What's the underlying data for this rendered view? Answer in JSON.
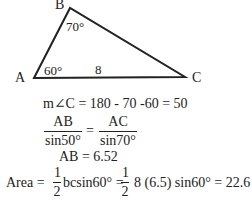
{
  "diagram": {
    "vertices": [
      {
        "name": "A",
        "label": "A"
      },
      {
        "name": "B",
        "label": "B"
      },
      {
        "name": "C",
        "label": "C"
      }
    ],
    "angle_A": "60°",
    "angle_B": "70°",
    "side_AC": "8"
  },
  "solution": {
    "line1": "m∠C = 180 - 70 -60 = 50",
    "law_of_sines": {
      "left_num": "AB",
      "left_den": "sin50°",
      "equals": "=",
      "right_num": "AC",
      "right_den": "sin70°"
    },
    "line3": "AB = 6.52",
    "area": {
      "prefix": "Area =",
      "frac1_num": "1",
      "frac1_den": "2",
      "mid": "bcsin60° =",
      "frac2_num": "1",
      "frac2_den": "2",
      "suffix": "8 (6.5) sin60° = 22.6"
    }
  }
}
